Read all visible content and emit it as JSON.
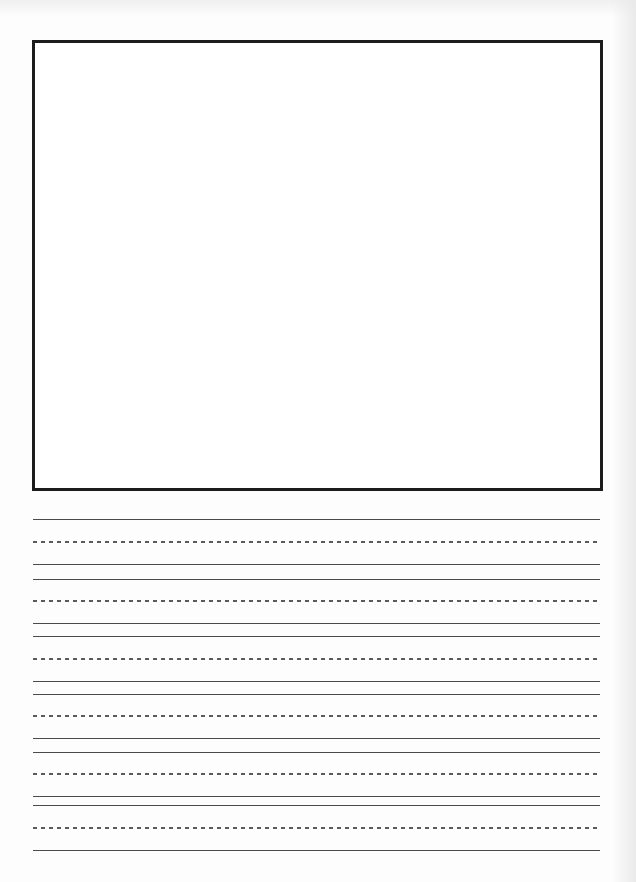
{
  "page": {
    "type": "handwriting-practice-sheet",
    "background": "#fdfdfd",
    "drawing_box": {
      "border_color": "#1c1c1c",
      "fill": "#ffffff"
    },
    "rule_color": "#4a4a4a",
    "writing_rows": [
      {
        "top": 519,
        "mid": 541,
        "base": 564
      },
      {
        "top": 579,
        "mid": 600,
        "base": 623
      },
      {
        "top": 636,
        "mid": 658,
        "base": 681
      },
      {
        "top": 694,
        "mid": 715,
        "base": 738
      },
      {
        "top": 752,
        "mid": 773,
        "base": 796
      },
      {
        "top": 805,
        "mid": 827,
        "base": 850
      }
    ]
  }
}
